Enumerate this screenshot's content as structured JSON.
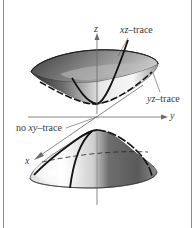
{
  "figure": {
    "axes": {
      "z_label": "z",
      "y_label": "y",
      "x_label": "x"
    },
    "annotations": {
      "xz_trace": {
        "var": "xz",
        "suffix": "–trace"
      },
      "yz_trace": {
        "var": "yz",
        "suffix": "–trace"
      },
      "no_xy_trace": {
        "prefix": "no ",
        "var": "xy",
        "suffix": "–trace"
      }
    },
    "colors": {
      "border": "#8a8a8a",
      "axis": "#6a6a6a",
      "trace": "#111111",
      "surface_dark": "#3c3c3c",
      "surface_light": "#f4f4f4",
      "label": "#3a3a3a"
    }
  }
}
